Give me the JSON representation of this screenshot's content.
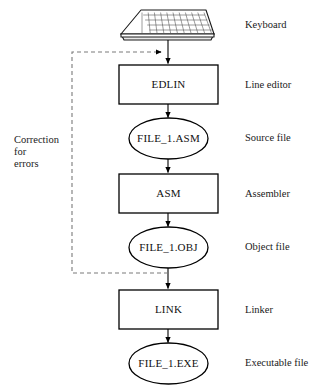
{
  "diagram": {
    "colors": {
      "stroke": "#000000",
      "dashed_stroke": "#7a7a7a",
      "background": "#ffffff",
      "text": "#1a1a1a"
    },
    "nodes": [
      {
        "id": "keyboard",
        "shape": "keyboard",
        "label": "",
        "side_label": "Keyboard"
      },
      {
        "id": "edlin",
        "shape": "box",
        "label": "EDLIN",
        "side_label": "Line editor"
      },
      {
        "id": "asm_file",
        "shape": "ellipse",
        "label": "FILE_1.ASM",
        "side_label": "Source file"
      },
      {
        "id": "asm",
        "shape": "box",
        "label": "ASM",
        "side_label": "Assembler"
      },
      {
        "id": "obj_file",
        "shape": "ellipse",
        "label": "FILE_1.OBJ",
        "side_label": "Object file"
      },
      {
        "id": "link",
        "shape": "box",
        "label": "LINK",
        "side_label": "Linker"
      },
      {
        "id": "exe_file",
        "shape": "ellipse",
        "label": "FILE_1.EXE",
        "side_label": "Executable file"
      }
    ],
    "feedback_loop": {
      "label_line1": "Correction",
      "label_line2": "for",
      "label_line3": "errors",
      "style": "dashed",
      "from": "obj_file",
      "to": "edlin"
    }
  }
}
